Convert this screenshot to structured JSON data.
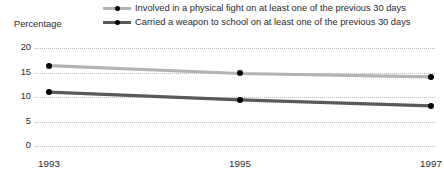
{
  "chart_data": {
    "type": "line",
    "title": "",
    "xlabel": "",
    "ylabel": "Percentage",
    "x": [
      "1993",
      "1995",
      "1997"
    ],
    "categories": [
      "1993",
      "1995",
      "1997"
    ],
    "ylim": [
      0,
      20
    ],
    "yticks": [
      "0",
      "5",
      "10",
      "15",
      "20"
    ],
    "grid": true,
    "legend_position": "top",
    "series": [
      {
        "name": "Involved in a physical fight on at least one of the previous 30 days",
        "values": [
          16.4,
          14.8,
          14.1
        ],
        "color": "#b3b3b3",
        "marker_color": "#000000"
      },
      {
        "name": "Carried a weapon to school on at least one of the previous 30 days",
        "values": [
          11.0,
          9.4,
          8.2
        ],
        "color": "#595959",
        "marker_color": "#000000"
      }
    ]
  },
  "legend": {
    "items": [
      {
        "label": "Involved in a physical fight on at least one of the previous 30 days"
      },
      {
        "label": "Carried a weapon to school on at least one of the previous 30 days"
      }
    ]
  },
  "axis": {
    "y_title": "Percentage",
    "y_ticks": [
      "20",
      "15",
      "10",
      "5",
      "0"
    ],
    "x_ticks": [
      "1993",
      "1995",
      "1997"
    ]
  },
  "colors": {
    "series_light": "#b3b3b3",
    "series_dark": "#595959",
    "marker": "#000000",
    "gridline": "#b9b9b9",
    "text": "#2b2b2b",
    "background": "#ffffff"
  }
}
